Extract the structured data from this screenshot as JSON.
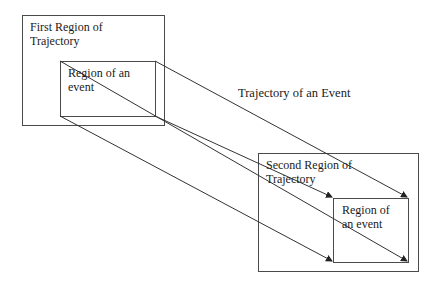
{
  "diagram": {
    "labels": {
      "first_region": "First Region of Trajectory",
      "first_region_line1": "First Region of",
      "first_region_line2": "Trajectory",
      "event_region_1_line1": "Region of an",
      "event_region_1_line2": "event",
      "trajectory": "Trajectory of an Event",
      "second_region_line1": "Second Region of",
      "second_region_line2": "Trajectory",
      "event_region_2_line1": "Region of",
      "event_region_2_line2": "an event"
    },
    "colors": {
      "line": "#4a4a4a",
      "text": "#1a1a1a",
      "background": "#ffffff"
    },
    "boxes": {
      "first_region": {
        "x": 22,
        "y": 15,
        "w": 142,
        "h": 110
      },
      "event_region_1": {
        "x": 60,
        "y": 61,
        "w": 95,
        "h": 55
      },
      "second_region": {
        "x": 258,
        "y": 153,
        "w": 160,
        "h": 118
      },
      "event_region_2": {
        "x": 333,
        "y": 198,
        "w": 75,
        "h": 64
      }
    },
    "arrows": [
      {
        "from": [
          60,
          61
        ],
        "to": [
          408,
          262
        ]
      },
      {
        "from": [
          155,
          61
        ],
        "to": [
          408,
          198
        ]
      },
      {
        "from": [
          60,
          116
        ],
        "to": [
          333,
          262
        ]
      },
      {
        "from": [
          155,
          116
        ],
        "to": [
          333,
          198
        ]
      }
    ]
  }
}
